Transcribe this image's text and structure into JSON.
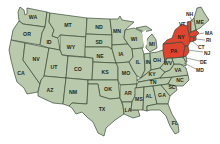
{
  "map": {
    "title": "United States map",
    "colors": {
      "default_fill": "#b9c9ab",
      "highlight_fill": "#e0442e",
      "border": "#3a4a38",
      "background": "#ffffff"
    },
    "highlighted_states": [
      "NY",
      "PA",
      "NJ",
      "CT",
      "RI",
      "MA",
      "VT"
    ],
    "states": [
      {
        "abbr": "WA"
      },
      {
        "abbr": "OR"
      },
      {
        "abbr": "CA"
      },
      {
        "abbr": "NV"
      },
      {
        "abbr": "ID"
      },
      {
        "abbr": "MT"
      },
      {
        "abbr": "WY"
      },
      {
        "abbr": "UT"
      },
      {
        "abbr": "AZ"
      },
      {
        "abbr": "CO"
      },
      {
        "abbr": "NM"
      },
      {
        "abbr": "ND"
      },
      {
        "abbr": "SD"
      },
      {
        "abbr": "NE"
      },
      {
        "abbr": "KS"
      },
      {
        "abbr": "OK"
      },
      {
        "abbr": "TX"
      },
      {
        "abbr": "MN"
      },
      {
        "abbr": "IA"
      },
      {
        "abbr": "MO"
      },
      {
        "abbr": "AR"
      },
      {
        "abbr": "LA"
      },
      {
        "abbr": "WI"
      },
      {
        "abbr": "IL"
      },
      {
        "abbr": "MI"
      },
      {
        "abbr": "IN"
      },
      {
        "abbr": "OH"
      },
      {
        "abbr": "KY"
      },
      {
        "abbr": "TN"
      },
      {
        "abbr": "MS"
      },
      {
        "abbr": "AL"
      },
      {
        "abbr": "GA"
      },
      {
        "abbr": "FL"
      },
      {
        "abbr": "SC"
      },
      {
        "abbr": "NC"
      },
      {
        "abbr": "VA"
      },
      {
        "abbr": "WV"
      },
      {
        "abbr": "PA"
      },
      {
        "abbr": "NY"
      },
      {
        "abbr": "VT"
      },
      {
        "abbr": "NH"
      },
      {
        "abbr": "ME"
      },
      {
        "abbr": "MA"
      },
      {
        "abbr": "RI"
      },
      {
        "abbr": "CT"
      },
      {
        "abbr": "NJ"
      },
      {
        "abbr": "DE"
      },
      {
        "abbr": "MD"
      }
    ],
    "labels": {
      "WA": "WA",
      "OR": "OR",
      "CA": "CA",
      "NV": "NV",
      "ID": "ID",
      "MT": "MT",
      "WY": "WY",
      "UT": "UT",
      "AZ": "AZ",
      "CO": "CO",
      "NM": "NM",
      "ND": "ND",
      "SD": "SD",
      "NE": "NE",
      "KS": "KS",
      "OK": "OK",
      "TX": "TX",
      "MN": "MN",
      "IA": "IA",
      "MO": "MO",
      "AR": "AR",
      "LA": "LA",
      "WI": "WI",
      "IL": "IL",
      "MI": "MI",
      "IN": "IN",
      "OH": "OH",
      "KY": "KY",
      "TN": "TN",
      "MS": "MS",
      "AL": "AL",
      "GA": "GA",
      "FL": "FL",
      "SC": "SC",
      "NC": "NC",
      "VA": "VA",
      "WV": "WV",
      "PA": "PA",
      "NY": "NY",
      "VT": "VT",
      "NH": "NH",
      "ME": "ME",
      "MA": "MA",
      "RI": "RI",
      "CT": "CT",
      "NJ": "NJ",
      "DE": "DE",
      "MD": "MD"
    }
  }
}
